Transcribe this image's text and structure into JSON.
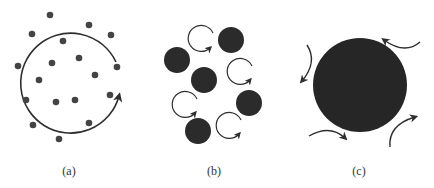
{
  "colors": {
    "ink": "#2e2e2e",
    "disk": "#2b2b2b",
    "background": "#ffffff"
  },
  "panels": [
    {
      "id": "a",
      "label": "(a)",
      "description": "Many small particles with one large circular flow arrow"
    },
    {
      "id": "b",
      "label": "(b)",
      "description": "Medium particles interleaved with small circular flow arrows"
    },
    {
      "id": "c",
      "label": "(c)",
      "description": "Single large particle surrounded by curved flow arrows"
    }
  ]
}
